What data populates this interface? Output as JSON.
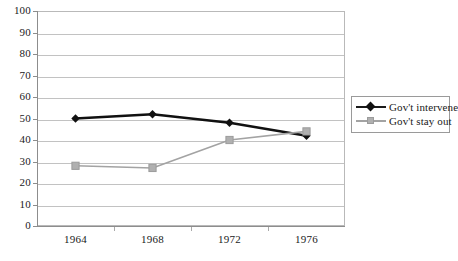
{
  "chart_data": {
    "type": "line",
    "title": "",
    "xlabel": "",
    "ylabel": "",
    "categories": [
      "1964",
      "1968",
      "1972",
      "1976"
    ],
    "x": [
      1964,
      1968,
      1972,
      1976
    ],
    "ylim": [
      0,
      100
    ],
    "yticks": [
      0,
      10,
      20,
      30,
      40,
      50,
      60,
      70,
      80,
      90,
      100
    ],
    "grid": true,
    "legend_position": "right",
    "series": [
      {
        "name": "Gov't intervene",
        "marker": "diamond",
        "color": "#111111",
        "values": [
          50,
          52,
          48,
          42
        ]
      },
      {
        "name": "Gov't stay out",
        "marker": "square",
        "color": "#a3a3a3",
        "values": [
          28,
          27,
          40,
          44
        ]
      }
    ]
  },
  "axes": {
    "y_tick_labels": [
      "100",
      "90",
      "80",
      "70",
      "60",
      "50",
      "40",
      "30",
      "20",
      "10",
      "0"
    ],
    "x_tick_labels": [
      "1964",
      "1968",
      "1972",
      "1976"
    ]
  },
  "legend": {
    "items": [
      {
        "label": "Gov't intervene"
      },
      {
        "label": "Gov't stay out"
      }
    ]
  }
}
